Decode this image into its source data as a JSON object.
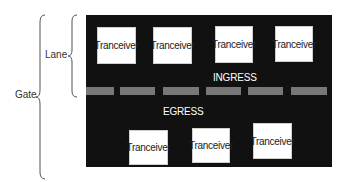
{
  "diagram": {
    "labels": {
      "gate": "Gate",
      "lane": "Lane",
      "ingress": "INGRESS",
      "egress": "EGRESS"
    },
    "top_transceivers": [
      {
        "label": "Tranceiver"
      },
      {
        "label": "Tranceiver"
      },
      {
        "label": "Tranceiver"
      },
      {
        "label": "Tranceiver"
      }
    ],
    "bottom_transceivers": [
      {
        "label": "Tranceiver"
      },
      {
        "label": "Tranceiver"
      },
      {
        "label": "Tranceiver"
      }
    ],
    "divider_segments": 6,
    "colors": {
      "panel": "#111111",
      "box": "#ffffff",
      "divider": "#777777",
      "text_on_panel": "#ffffff"
    }
  }
}
